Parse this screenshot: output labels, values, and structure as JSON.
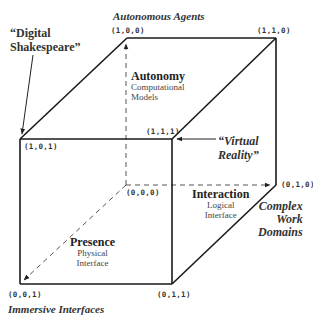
{
  "diagram": {
    "type": "3d-cube",
    "vertices": [
      {
        "id": "v100",
        "label": "(1,0,0)"
      },
      {
        "id": "v110",
        "label": "(1,1,0)"
      },
      {
        "id": "v101",
        "label": "(1,0,1)"
      },
      {
        "id": "v111",
        "label": "(1,1,1)"
      },
      {
        "id": "v000",
        "label": "(0,0,0)"
      },
      {
        "id": "v010",
        "label": "(0,1,0)"
      },
      {
        "id": "v001",
        "label": "(0,0,1)"
      },
      {
        "id": "v011",
        "label": "(0,1,1)"
      }
    ],
    "corner_labels": {
      "autonomous_agents": "Autonomous Agents",
      "digital_shakespeare_1": "“Digital",
      "digital_shakespeare_2": "Shakespeare”",
      "virtual_reality_1": "“Virtual",
      "virtual_reality_2": "Reality”",
      "complex_work_domains_1": "Complex",
      "complex_work_domains_2": "Work",
      "complex_work_domains_3": "Domains",
      "immersive_interfaces": "Immersive Interfaces"
    },
    "axes": {
      "autonomy": {
        "title": "Autonomy",
        "sub1": "Computational",
        "sub2": "Models"
      },
      "interaction": {
        "title": "Interaction",
        "sub1": "Logical",
        "sub2": "Interface"
      },
      "presence": {
        "title": "Presence",
        "sub1": "Physical",
        "sub2": "Interface"
      }
    },
    "colors": {
      "line": "#1a1a1a",
      "dash": "#555555",
      "background": "#ffffff"
    }
  }
}
